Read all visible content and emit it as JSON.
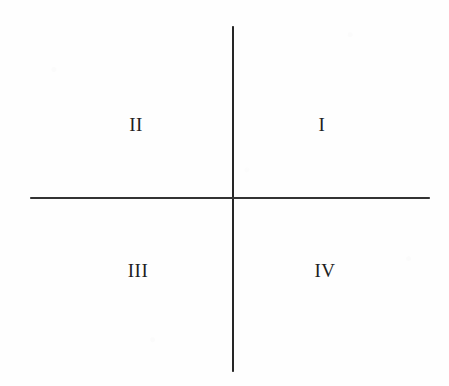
{
  "diagram": {
    "background_color": "#fefefe",
    "line_color": "#262626",
    "text_color": "#1f1f1f",
    "axes": {
      "vertical": {
        "name": "y-axis",
        "x": 232,
        "top": 26,
        "bottom": 372,
        "thickness": 2
      },
      "horizontal": {
        "name": "x-axis",
        "y": 198,
        "left": 30,
        "right": 430,
        "thickness": 2
      }
    },
    "origin": {
      "x": 232,
      "y": 198
    },
    "quadrants": [
      {
        "id": "quadrant-1",
        "label": "I",
        "position": "upper-right",
        "x": 322,
        "y": 124
      },
      {
        "id": "quadrant-2",
        "label": "II",
        "position": "upper-left",
        "x": 136,
        "y": 124
      },
      {
        "id": "quadrant-3",
        "label": "III",
        "position": "lower-left",
        "x": 138,
        "y": 270
      },
      {
        "id": "quadrant-4",
        "label": "IV",
        "position": "lower-right",
        "x": 325,
        "y": 270
      }
    ]
  }
}
